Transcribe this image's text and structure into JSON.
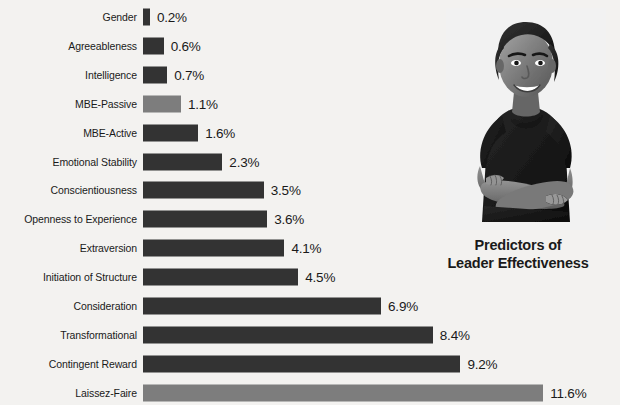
{
  "title": {
    "line1": "Predictors of",
    "line2": "Leader Effectiveness"
  },
  "photo": {
    "alt": "Smiling businesswoman with arms crossed, black and white photo"
  },
  "chart_data": {
    "type": "bar",
    "orientation": "horizontal",
    "title": "Predictors of Leader Effectiveness",
    "xlabel": "",
    "ylabel": "",
    "xlim": [
      0,
      11.6
    ],
    "grid": false,
    "legend": false,
    "value_suffix": "%",
    "categories": [
      "Gender",
      "Agreeableness",
      "Intelligence",
      "MBE-Passive",
      "MBE-Active",
      "Emotional Stability",
      "Conscientiousness",
      "Openness to Experience",
      "Extraversion",
      "Initiation of Structure",
      "Consideration",
      "Transformational",
      "Contingent Reward",
      "Laissez-Faire"
    ],
    "values": [
      0.2,
      0.6,
      0.7,
      1.1,
      1.6,
      2.3,
      3.5,
      3.6,
      4.1,
      4.5,
      6.9,
      8.4,
      9.2,
      11.6
    ],
    "value_labels": [
      "0.2%",
      "0.6%",
      "0.7%",
      "1.1%",
      "1.6%",
      "2.3%",
      "3.5%",
      "3.6%",
      "4.1%",
      "4.5%",
      "6.9%",
      "8.4%",
      "9.2%",
      "11.6%"
    ],
    "bar_colors": [
      "#333333",
      "#333333",
      "#333333",
      "#7d7d7d",
      "#333333",
      "#333333",
      "#333333",
      "#333333",
      "#333333",
      "#333333",
      "#333333",
      "#333333",
      "#333333",
      "#7d7d7d"
    ]
  },
  "style": {
    "background": "#f3f2f0",
    "bar_dark": "#333333",
    "bar_light": "#7d7d7d",
    "text": "#1a1a1a"
  }
}
